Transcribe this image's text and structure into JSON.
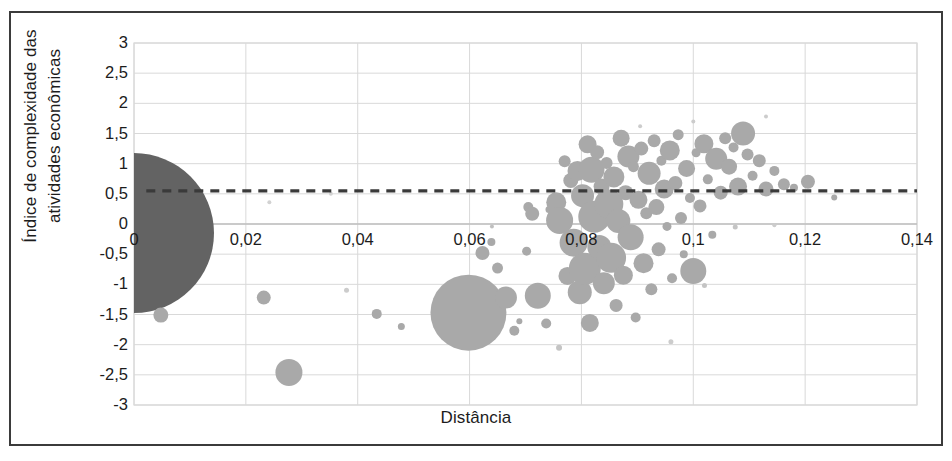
{
  "chart_data": {
    "type": "scatter",
    "title": "",
    "xlabel": "Distância",
    "ylabel": "Índice de complexidade das atividades econômicas",
    "ylabel_line1": "Índice de complexidade das",
    "ylabel_line2": "atividades econômicas",
    "xlim": [
      0,
      0.14
    ],
    "ylim": [
      -3,
      3
    ],
    "xticks": [
      "0",
      "0,02",
      "0,04",
      "0,06",
      "0,08",
      "0,1",
      "0,12",
      "0,14"
    ],
    "xtick_values": [
      0,
      0.02,
      0.04,
      0.06,
      0.08,
      0.1,
      0.12,
      0.14
    ],
    "yticks": [
      "3",
      "2,5",
      "2",
      "1,5",
      "1",
      "0,5",
      "0",
      "-0,5",
      "-1",
      "-1,5",
      "-2",
      "-2,5",
      "-3"
    ],
    "ytick_values": [
      3,
      2.5,
      2,
      1.5,
      1,
      0.5,
      0,
      -0.5,
      -1,
      -1.5,
      -2,
      -2.5,
      -3
    ],
    "grid": "both",
    "legend": "none",
    "bubble_color": "#a9a9a9",
    "highlight_color": "#636363",
    "grid_color": "#d9d9d9",
    "axis_color": "#bfbfbf",
    "reference_line": {
      "orientation": "horizontal",
      "y": 0.55,
      "style": "dashed",
      "color": "#3a3a3a",
      "x_start": 0.0022,
      "x_end": 0.14
    },
    "note": "Bubble chart: x = Distância, y = Índice de complexidade das atividades econômicas; bubble area encodes a third magnitude.",
    "points": [
      {
        "x": 0.0,
        "y": -0.15,
        "r": 80,
        "color": "#636363"
      },
      {
        "x": 0.0048,
        "y": -1.51,
        "r": 7.5,
        "color": "#a9a9a9"
      },
      {
        "x": 0.0232,
        "y": -1.22,
        "r": 7.0,
        "color": "#a9a9a9"
      },
      {
        "x": 0.0277,
        "y": -2.46,
        "r": 13.5,
        "color": "#a9a9a9"
      },
      {
        "x": 0.0434,
        "y": -1.49,
        "r": 5.0,
        "color": "#a9a9a9"
      },
      {
        "x": 0.0478,
        "y": -1.7,
        "r": 3.5,
        "color": "#a9a9a9"
      },
      {
        "x": 0.0546,
        "y": -1.66,
        "r": 4.0,
        "color": "#a9a9a9"
      },
      {
        "x": 0.0598,
        "y": -1.47,
        "r": 38.0,
        "color": "#a9a9a9"
      },
      {
        "x": 0.0623,
        "y": -0.48,
        "r": 7.0,
        "color": "#a9a9a9"
      },
      {
        "x": 0.0639,
        "y": -0.3,
        "r": 4.0,
        "color": "#a9a9a9"
      },
      {
        "x": 0.065,
        "y": -0.73,
        "r": 5.5,
        "color": "#a9a9a9"
      },
      {
        "x": 0.0665,
        "y": -1.22,
        "r": 11.0,
        "color": "#a9a9a9"
      },
      {
        "x": 0.068,
        "y": -1.77,
        "r": 5.0,
        "color": "#a9a9a9"
      },
      {
        "x": 0.0689,
        "y": -1.61,
        "r": 3.0,
        "color": "#a9a9a9"
      },
      {
        "x": 0.0702,
        "y": -0.45,
        "r": 4.5,
        "color": "#a9a9a9"
      },
      {
        "x": 0.0705,
        "y": 0.28,
        "r": 5.0,
        "color": "#a9a9a9"
      },
      {
        "x": 0.0712,
        "y": 0.17,
        "r": 7.0,
        "color": "#a9a9a9"
      },
      {
        "x": 0.0722,
        "y": -1.19,
        "r": 13.0,
        "color": "#a9a9a9"
      },
      {
        "x": 0.0737,
        "y": -1.65,
        "r": 5.0,
        "color": "#a9a9a9"
      },
      {
        "x": 0.0742,
        "y": 0.24,
        "r": 3.5,
        "color": "#a9a9a9"
      },
      {
        "x": 0.0748,
        "y": -0.02,
        "r": 4.0,
        "color": "#a9a9a9"
      },
      {
        "x": 0.0755,
        "y": 0.36,
        "r": 10.0,
        "color": "#a9a9a9"
      },
      {
        "x": 0.0761,
        "y": 0.06,
        "r": 13.5,
        "color": "#a9a9a9"
      },
      {
        "x": 0.077,
        "y": 1.04,
        "r": 6.0,
        "color": "#a9a9a9"
      },
      {
        "x": 0.0775,
        "y": -0.86,
        "r": 9.0,
        "color": "#a9a9a9"
      },
      {
        "x": 0.0781,
        "y": 0.72,
        "r": 7.5,
        "color": "#a9a9a9"
      },
      {
        "x": 0.0786,
        "y": -0.31,
        "r": 14.0,
        "color": "#a9a9a9"
      },
      {
        "x": 0.0793,
        "y": 0.88,
        "r": 10.0,
        "color": "#a9a9a9"
      },
      {
        "x": 0.0797,
        "y": -1.13,
        "r": 12.0,
        "color": "#a9a9a9"
      },
      {
        "x": 0.0802,
        "y": 0.47,
        "r": 11.5,
        "color": "#a9a9a9"
      },
      {
        "x": 0.0806,
        "y": -0.74,
        "r": 16.0,
        "color": "#a9a9a9"
      },
      {
        "x": 0.0811,
        "y": 1.32,
        "r": 9.0,
        "color": "#a9a9a9"
      },
      {
        "x": 0.0815,
        "y": -1.64,
        "r": 9.0,
        "color": "#a9a9a9"
      },
      {
        "x": 0.0818,
        "y": 0.9,
        "r": 13.0,
        "color": "#a9a9a9"
      },
      {
        "x": 0.0823,
        "y": 0.12,
        "r": 16.0,
        "color": "#a9a9a9"
      },
      {
        "x": 0.0828,
        "y": 1.19,
        "r": 7.0,
        "color": "#a9a9a9"
      },
      {
        "x": 0.0832,
        "y": -0.38,
        "r": 12.0,
        "color": "#a9a9a9"
      },
      {
        "x": 0.0836,
        "y": 0.62,
        "r": 8.0,
        "color": "#a9a9a9"
      },
      {
        "x": 0.084,
        "y": -0.98,
        "r": 11.0,
        "color": "#a9a9a9"
      },
      {
        "x": 0.0845,
        "y": 1.01,
        "r": 6.0,
        "color": "#a9a9a9"
      },
      {
        "x": 0.0849,
        "y": 0.33,
        "r": 14.5,
        "color": "#a9a9a9"
      },
      {
        "x": 0.0853,
        "y": -0.56,
        "r": 15.0,
        "color": "#a9a9a9"
      },
      {
        "x": 0.0858,
        "y": 0.78,
        "r": 10.5,
        "color": "#a9a9a9"
      },
      {
        "x": 0.0862,
        "y": -1.35,
        "r": 6.5,
        "color": "#a9a9a9"
      },
      {
        "x": 0.0866,
        "y": 0.05,
        "r": 12.0,
        "color": "#a9a9a9"
      },
      {
        "x": 0.0871,
        "y": 1.42,
        "r": 8.5,
        "color": "#a9a9a9"
      },
      {
        "x": 0.0875,
        "y": -0.85,
        "r": 9.5,
        "color": "#a9a9a9"
      },
      {
        "x": 0.0879,
        "y": 0.52,
        "r": 7.5,
        "color": "#a9a9a9"
      },
      {
        "x": 0.0884,
        "y": 1.12,
        "r": 11.0,
        "color": "#a9a9a9"
      },
      {
        "x": 0.0888,
        "y": -0.22,
        "r": 13.0,
        "color": "#a9a9a9"
      },
      {
        "x": 0.0893,
        "y": 0.95,
        "r": 5.5,
        "color": "#a9a9a9"
      },
      {
        "x": 0.0897,
        "y": -1.55,
        "r": 5.0,
        "color": "#a9a9a9"
      },
      {
        "x": 0.0902,
        "y": 0.4,
        "r": 9.0,
        "color": "#a9a9a9"
      },
      {
        "x": 0.0907,
        "y": 1.25,
        "r": 7.0,
        "color": "#a9a9a9"
      },
      {
        "x": 0.0911,
        "y": -0.65,
        "r": 10.0,
        "color": "#a9a9a9"
      },
      {
        "x": 0.0916,
        "y": 0.18,
        "r": 6.0,
        "color": "#a9a9a9"
      },
      {
        "x": 0.0921,
        "y": 0.84,
        "r": 11.5,
        "color": "#a9a9a9"
      },
      {
        "x": 0.0925,
        "y": -1.08,
        "r": 6.0,
        "color": "#a9a9a9"
      },
      {
        "x": 0.093,
        "y": 1.38,
        "r": 6.5,
        "color": "#a9a9a9"
      },
      {
        "x": 0.0934,
        "y": 0.28,
        "r": 8.0,
        "color": "#a9a9a9"
      },
      {
        "x": 0.0938,
        "y": -0.42,
        "r": 7.0,
        "color": "#a9a9a9"
      },
      {
        "x": 0.0943,
        "y": 1.05,
        "r": 5.0,
        "color": "#a9a9a9"
      },
      {
        "x": 0.0948,
        "y": 0.58,
        "r": 9.5,
        "color": "#a9a9a9"
      },
      {
        "x": 0.0953,
        "y": -0.04,
        "r": 4.5,
        "color": "#a9a9a9"
      },
      {
        "x": 0.0958,
        "y": 1.22,
        "r": 10.0,
        "color": "#a9a9a9"
      },
      {
        "x": 0.0962,
        "y": -0.9,
        "r": 5.0,
        "color": "#a9a9a9"
      },
      {
        "x": 0.0968,
        "y": 0.68,
        "r": 7.0,
        "color": "#a9a9a9"
      },
      {
        "x": 0.0973,
        "y": 1.48,
        "r": 5.5,
        "color": "#a9a9a9"
      },
      {
        "x": 0.0978,
        "y": 0.1,
        "r": 6.0,
        "color": "#a9a9a9"
      },
      {
        "x": 0.0983,
        "y": -0.5,
        "r": 4.0,
        "color": "#a9a9a9"
      },
      {
        "x": 0.0988,
        "y": 0.92,
        "r": 8.5,
        "color": "#a9a9a9"
      },
      {
        "x": 0.0994,
        "y": 0.43,
        "r": 5.0,
        "color": "#a9a9a9"
      },
      {
        "x": 0.1,
        "y": -0.78,
        "r": 13.0,
        "color": "#a9a9a9"
      },
      {
        "x": 0.1005,
        "y": 1.18,
        "r": 4.5,
        "color": "#a9a9a9"
      },
      {
        "x": 0.1012,
        "y": 0.3,
        "r": 6.5,
        "color": "#a9a9a9"
      },
      {
        "x": 0.1019,
        "y": 1.33,
        "r": 9.5,
        "color": "#a9a9a9"
      },
      {
        "x": 0.1026,
        "y": 0.74,
        "r": 5.0,
        "color": "#a9a9a9"
      },
      {
        "x": 0.1034,
        "y": -0.18,
        "r": 4.0,
        "color": "#a9a9a9"
      },
      {
        "x": 0.1041,
        "y": 1.08,
        "r": 11.0,
        "color": "#a9a9a9"
      },
      {
        "x": 0.1049,
        "y": 0.52,
        "r": 7.0,
        "color": "#a9a9a9"
      },
      {
        "x": 0.1057,
        "y": 1.42,
        "r": 6.0,
        "color": "#a9a9a9"
      },
      {
        "x": 0.1064,
        "y": 0.95,
        "r": 8.0,
        "color": "#a9a9a9"
      },
      {
        "x": 0.1072,
        "y": 1.27,
        "r": 5.0,
        "color": "#a9a9a9"
      },
      {
        "x": 0.108,
        "y": 0.62,
        "r": 9.0,
        "color": "#a9a9a9"
      },
      {
        "x": 0.1089,
        "y": 1.5,
        "r": 12.0,
        "color": "#a9a9a9"
      },
      {
        "x": 0.1097,
        "y": 1.15,
        "r": 6.0,
        "color": "#a9a9a9"
      },
      {
        "x": 0.1106,
        "y": 0.8,
        "r": 5.0,
        "color": "#a9a9a9"
      },
      {
        "x": 0.1118,
        "y": 1.05,
        "r": 6.5,
        "color": "#a9a9a9"
      },
      {
        "x": 0.113,
        "y": 0.58,
        "r": 7.5,
        "color": "#a9a9a9"
      },
      {
        "x": 0.1145,
        "y": 0.88,
        "r": 5.0,
        "color": "#a9a9a9"
      },
      {
        "x": 0.1162,
        "y": 0.66,
        "r": 6.0,
        "color": "#a9a9a9"
      },
      {
        "x": 0.118,
        "y": 0.6,
        "r": 4.0,
        "color": "#a9a9a9"
      },
      {
        "x": 0.1205,
        "y": 0.7,
        "r": 7.0,
        "color": "#a9a9a9"
      },
      {
        "x": 0.1252,
        "y": 0.44,
        "r": 3.0,
        "color": "#a9a9a9"
      },
      {
        "x": 0.064,
        "y": -0.04,
        "r": 2.0,
        "color": "#bfbfbf"
      },
      {
        "x": 0.0905,
        "y": 1.62,
        "r": 2.0,
        "color": "#cccccc"
      },
      {
        "x": 0.1,
        "y": 1.7,
        "r": 2.0,
        "color": "#cccccc"
      },
      {
        "x": 0.113,
        "y": 1.78,
        "r": 2.0,
        "color": "#cccccc"
      },
      {
        "x": 0.1075,
        "y": -0.05,
        "r": 2.5,
        "color": "#c4c4c4"
      },
      {
        "x": 0.1145,
        "y": -0.02,
        "r": 2.0,
        "color": "#cccccc"
      },
      {
        "x": 0.102,
        "y": -1.02,
        "r": 2.5,
        "color": "#c4c4c4"
      },
      {
        "x": 0.076,
        "y": -2.05,
        "r": 3.0,
        "color": "#c4c4c4"
      },
      {
        "x": 0.096,
        "y": -1.95,
        "r": 2.5,
        "color": "#cccccc"
      },
      {
        "x": 0.038,
        "y": -1.1,
        "r": 2.5,
        "color": "#cccccc"
      },
      {
        "x": 0.0352,
        "y": 0.5,
        "r": 2.0,
        "color": "#d2d2d2"
      },
      {
        "x": 0.0242,
        "y": 0.36,
        "r": 2.0,
        "color": "#d2d2d2"
      }
    ]
  }
}
